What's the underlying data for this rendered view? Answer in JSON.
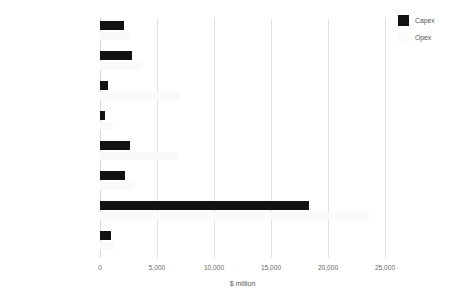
{
  "chart_data": {
    "type": "bar",
    "orientation": "horizontal",
    "title": "",
    "xlabel": "$ million",
    "ylabel": "",
    "xlim": [
      0,
      25000
    ],
    "xticks": [
      "0",
      "5,000",
      "10,000",
      "15,000",
      "20,000",
      "25,000"
    ],
    "xtick_values": [
      0,
      5000,
      10000,
      15000,
      20000,
      25000
    ],
    "grid": true,
    "legend_position": "top-right",
    "categories": [
      "North America",
      "Latin America/Caribbean",
      "Western Europe",
      "Eastern Europe/Central Asia",
      "East Asia/Pacific",
      "Southern Asia",
      "Middle East/North Africa",
      "Sub-Saharan Africa"
    ],
    "series": [
      {
        "name": "Capex",
        "color": "#121212",
        "values": [
          2100,
          2800,
          700,
          450,
          2600,
          2200,
          18350,
          950
        ]
      },
      {
        "name": "Opex",
        "color": "#fafafa",
        "values": [
          2600,
          3600,
          7000,
          1100,
          6900,
          2900,
          23650,
          1250
        ]
      }
    ]
  },
  "legend": {
    "items": [
      {
        "label": "Capex",
        "swatch": "capex-swatch"
      },
      {
        "label": "Opex",
        "swatch": "opex-swatch"
      }
    ]
  },
  "colors": {
    "capex": "#121212",
    "opex": "#fafafa",
    "gridline": "#e2e2e2",
    "text": "#555555",
    "background": "#ffffff"
  }
}
